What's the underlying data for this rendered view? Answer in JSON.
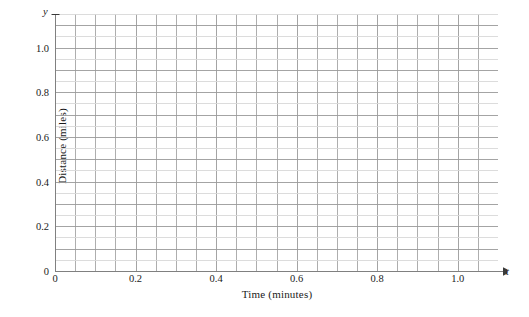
{
  "chart_data": {
    "type": "line",
    "title": "",
    "subtitle": "",
    "xlabel": "Time (minutes)",
    "ylabel": "Distance (miles)",
    "x_axis_variable": "t",
    "y_axis_variable": "y",
    "xlim": [
      0,
      1.1
    ],
    "ylim": [
      0,
      1.15
    ],
    "x_tick_values": [
      0,
      0.2,
      0.4,
      0.6,
      0.8,
      1.0
    ],
    "x_tick_labels": [
      "0",
      "0.2",
      "0.4",
      "0.6",
      "0.8",
      "1.0"
    ],
    "y_tick_values": [
      0,
      0.2,
      0.4,
      0.6,
      0.8,
      1.0
    ],
    "y_tick_labels": [
      "0",
      "0.2",
      "0.4",
      "0.6",
      "0.8",
      "1.0"
    ],
    "x_minor_step": 0.05,
    "y_minor_step": 0.05,
    "grid": true,
    "grid_major_color": "#9a9a9a",
    "grid_minor_color": "#d8d8d8",
    "axis_color": "#808080",
    "background_color": "#ffffff",
    "legend": [],
    "series": [],
    "annotations": []
  },
  "axes": {
    "x_title": "Time (minutes)",
    "y_title": "Distance (miles)",
    "x_symbol": "t",
    "y_symbol": "y"
  }
}
